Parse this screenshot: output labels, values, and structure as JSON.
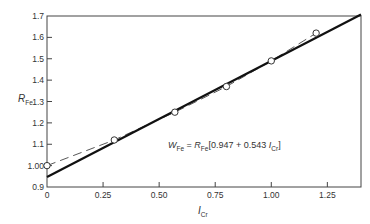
{
  "chart_data": {
    "type": "scatter",
    "title": "",
    "xlabel": "I_Cr",
    "ylabel": "R_Fe",
    "xlim": [
      0,
      1.4
    ],
    "ylim": [
      0.9,
      1.7
    ],
    "grid": false,
    "x_ticks": [
      0,
      0.25,
      0.5,
      0.75,
      1.0,
      1.25
    ],
    "x_tick_labels": [
      "0",
      "0.25",
      "0.50",
      "0.75",
      "1.00",
      "1.25"
    ],
    "y_ticks": [
      0.9,
      1.0,
      1.1,
      1.2,
      1.3,
      1.4,
      1.5,
      1.6,
      1.7
    ],
    "y_tick_labels": [
      "0.9",
      "1.00",
      "1.1",
      "1.2",
      "1.3",
      "1.4",
      "1.5",
      "1.6",
      "1.7"
    ],
    "series": [
      {
        "name": "Measured data",
        "style": "open-circle",
        "x": [
          0,
          0.3,
          0.57,
          0.8,
          1.0,
          1.2
        ],
        "y": [
          1.0,
          1.12,
          1.25,
          1.37,
          1.49,
          1.62
        ]
      },
      {
        "name": "Dashed fit curve",
        "style": "dashed-line",
        "x": [
          0,
          0.3,
          0.57,
          0.8,
          1.0,
          1.2
        ],
        "y": [
          1.0,
          1.12,
          1.25,
          1.37,
          1.49,
          1.62
        ]
      },
      {
        "name": "Linear fit",
        "style": "solid-line",
        "equation": "W_Fe = R_Fe[0.947 + 0.543 I_Cr]",
        "intercept": 0.947,
        "slope": 0.543,
        "x": [
          0,
          1.4
        ],
        "y": [
          0.947,
          1.707
        ]
      }
    ],
    "annotations": [
      {
        "text": "W_Fe = R_Fe[0.947 + 0.543 I_Cr]",
        "x": 0.78,
        "y": 1.14
      }
    ]
  },
  "labels": {
    "xlabel_main": "I",
    "xlabel_sub": "Cr",
    "ylabel_main": "R",
    "ylabel_sub": "Fe",
    "eq_w": "W",
    "eq_w_sub": "Fe",
    "eq_equals": " = ",
    "eq_r": "R",
    "eq_r_sub": "Fe",
    "eq_body": "[0.947 + 0.543 ",
    "eq_i": "I",
    "eq_i_sub": "Cr",
    "eq_close": "]"
  }
}
